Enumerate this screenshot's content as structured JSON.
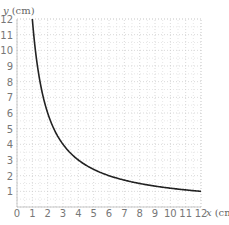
{
  "chart_data": {
    "type": "line",
    "title": "",
    "xlabel": "x (cm)",
    "ylabel": "y (cm)",
    "xlim": [
      0,
      12
    ],
    "ylim": [
      0,
      12
    ],
    "grid": true,
    "x_ticks": [
      "0",
      "1",
      "2",
      "3",
      "4",
      "5",
      "6",
      "7",
      "8",
      "9",
      "10",
      "11",
      "12"
    ],
    "y_ticks": [
      "1",
      "2",
      "3",
      "4",
      "5",
      "6",
      "7",
      "8",
      "9",
      "10",
      "11",
      "12"
    ],
    "series": [
      {
        "name": "y = 12/x",
        "x": [
          1,
          1.5,
          2,
          2.5,
          3,
          4,
          5,
          6,
          7,
          8,
          9,
          10,
          11,
          12
        ],
        "values": [
          12,
          8,
          6,
          4.8,
          4,
          3,
          2.4,
          2,
          1.71,
          1.5,
          1.33,
          1.2,
          1.09,
          1
        ]
      }
    ],
    "colors": {
      "curve": "#222222",
      "grid": "#bbbbbb",
      "text": "#777777"
    }
  },
  "axes": {
    "x_label_var": "x",
    "x_label_unit": "(cm)",
    "y_label_var": "y",
    "y_label_unit": "(cm)",
    "origin": "0"
  }
}
